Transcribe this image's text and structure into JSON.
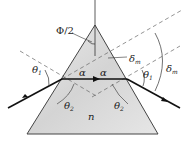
{
  "diagram": {
    "labels": {
      "half_apex": "Φ/2",
      "alpha_left": "α",
      "alpha_right": "α",
      "theta1_left": "θ",
      "theta1_left_sub": "1",
      "theta1_right": "θ",
      "theta1_right_sub": "1",
      "theta2_left": "θ",
      "theta2_left_sub": "2",
      "theta2_right": "θ",
      "theta2_right_sub": "2",
      "delta_inner": "δ",
      "delta_inner_sub": "m",
      "delta_outer": "δ",
      "delta_outer_sub": "m",
      "index": "n"
    },
    "colors": {
      "prism_fill": "#d9d9d9",
      "prism_edge": "#444444",
      "ray": "#111111",
      "dashed": "#666666"
    }
  }
}
